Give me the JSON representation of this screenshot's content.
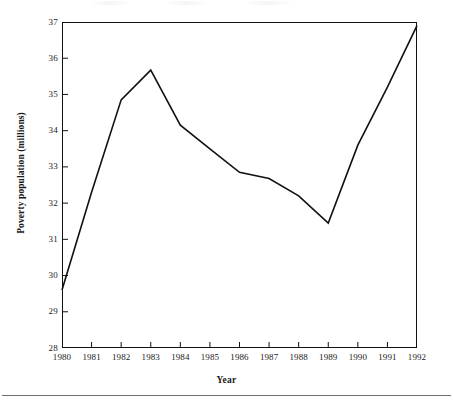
{
  "figure": {
    "background_color": "#ffffff",
    "line_color": "#111111",
    "axis_color": "#111111"
  },
  "axes": {
    "y_title": "Poverty population (millions)",
    "x_title": "Year",
    "y_ticks": [
      "28",
      "29",
      "30",
      "31",
      "32",
      "33",
      "34",
      "35",
      "36",
      "37"
    ],
    "x_ticks": [
      "1980",
      "1981",
      "1982",
      "1983",
      "1984",
      "1985",
      "1986",
      "1987",
      "1988",
      "1989",
      "1990",
      "1991",
      "1992"
    ]
  },
  "chart_data": {
    "type": "line",
    "title": "",
    "subtitle": "",
    "xlabel": "Year",
    "ylabel": "Poverty population (millions)",
    "x": [
      1980,
      1981,
      1982,
      1983,
      1984,
      1985,
      1986,
      1987,
      1988,
      1989,
      1990,
      1991,
      1992
    ],
    "categories": [
      "1980",
      "1981",
      "1982",
      "1983",
      "1984",
      "1985",
      "1986",
      "1987",
      "1988",
      "1989",
      "1990",
      "1991",
      "1992"
    ],
    "values": [
      29.6,
      32.3,
      34.85,
      35.67,
      34.15,
      33.5,
      32.85,
      32.68,
      32.2,
      31.45,
      33.6,
      35.2,
      36.9
    ],
    "series": [
      {
        "name": "Poverty population",
        "values": [
          29.6,
          32.3,
          34.85,
          35.67,
          34.15,
          33.5,
          32.85,
          32.68,
          32.2,
          31.45,
          33.6,
          35.2,
          36.9
        ]
      }
    ],
    "xlim": [
      1980,
      1992
    ],
    "ylim": [
      28,
      37
    ],
    "y_tick_values": [
      28,
      29,
      30,
      31,
      32,
      33,
      34,
      35,
      36,
      37
    ],
    "x_tick_values": [
      1980,
      1981,
      1982,
      1983,
      1984,
      1985,
      1986,
      1987,
      1988,
      1989,
      1990,
      1991,
      1992
    ],
    "grid": false,
    "legend": false,
    "legend_position": "none",
    "markers": false,
    "line_width": 1.6,
    "line_color": "#111111",
    "annotations": []
  }
}
